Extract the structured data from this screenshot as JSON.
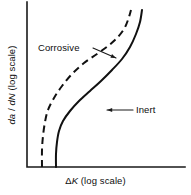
{
  "chart_data": {
    "type": "line",
    "title": "",
    "subtitle": "",
    "xlabel": "ΔK (log scale)",
    "ylabel": "da / dN (log scale)",
    "xlabel_parts": {
      "delta": "Δ",
      "symbol": "K",
      "suffix": " (log scale)"
    },
    "ylabel_parts": {
      "numerator": "da",
      "slash": " / ",
      "denominator": "dN",
      "suffix": " (log scale)"
    },
    "axis_scale_x": "log",
    "axis_scale_y": "log",
    "grid": false,
    "tick_labels_x": [],
    "tick_labels_y": [],
    "legend_position": "inline-annotations",
    "axis_frame": "left-and-bottom",
    "series": [
      {
        "name": "Corrosive",
        "style": "dashed",
        "color": "#111111",
        "description": "Sigmoidal crack growth curve shifted to lower ΔK; faster growth in corrosive environment",
        "points": [
          [
            42,
            167
          ],
          [
            42,
            150
          ],
          [
            43,
            136
          ],
          [
            45,
            122
          ],
          [
            48,
            110
          ],
          [
            54,
            98
          ],
          [
            62,
            86
          ],
          [
            72,
            74
          ],
          [
            84,
            63
          ],
          [
            97,
            54
          ],
          [
            108,
            46
          ],
          [
            117,
            38
          ],
          [
            124,
            29
          ],
          [
            128,
            20
          ],
          [
            131,
            10
          ]
        ]
      },
      {
        "name": "Inert",
        "style": "solid",
        "color": "#111111",
        "description": "Sigmoidal crack growth curve at higher ΔK; baseline inert environment behaviour",
        "points": [
          [
            56,
            167
          ],
          [
            56,
            154
          ],
          [
            57,
            142
          ],
          [
            59,
            131
          ],
          [
            63,
            121
          ],
          [
            70,
            111
          ],
          [
            79,
            101
          ],
          [
            90,
            91
          ],
          [
            101,
            81
          ],
          [
            112,
            70
          ],
          [
            122,
            59
          ],
          [
            130,
            47
          ],
          [
            136,
            34
          ],
          [
            140,
            22
          ],
          [
            142,
            10
          ]
        ]
      }
    ],
    "annotations": [
      {
        "name": "Corrosive",
        "text_position": [
          38,
          43
        ],
        "leader_from": [
          93,
          48
        ],
        "leader_to": [
          116,
          58
        ],
        "arrow": true
      },
      {
        "name": "Inert",
        "text_position": [
          136,
          105
        ],
        "leader_from": [
          133,
          110
        ],
        "leader_to": [
          107,
          110
        ],
        "arrow": true
      }
    ]
  },
  "labels": {
    "corrosive": "Corrosive",
    "inert": "Inert",
    "x_delta": "Δ",
    "x_symbol": "K",
    "x_suffix": " (log scale)",
    "y_numerator": "da",
    "y_slash": " / ",
    "y_denominator": "dN",
    "y_suffix": " (log scale)"
  },
  "colors": {
    "background": "#ffffff",
    "ink": "#111111",
    "axis": "#1a1a1a"
  }
}
